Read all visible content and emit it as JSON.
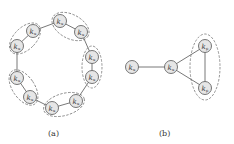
{
  "figure": {
    "panels": [
      {
        "id": "a",
        "caption": "(a)",
        "nodes": [
          {
            "label": "k",
            "sub": "u",
            "x": 60,
            "y": 21
          },
          {
            "label": "k",
            "sub": "u",
            "x": 81,
            "y": 32
          },
          {
            "label": "k",
            "sub": "u",
            "x": 92,
            "y": 57
          },
          {
            "label": "k",
            "sub": "u",
            "x": 92,
            "y": 77
          },
          {
            "label": "k",
            "sub": "u",
            "x": 76,
            "y": 101
          },
          {
            "label": "k",
            "sub": "u",
            "x": 52,
            "y": 108
          },
          {
            "label": "k",
            "sub": "u",
            "x": 30,
            "y": 97
          },
          {
            "label": "k",
            "sub": "u",
            "x": 17,
            "y": 78
          },
          {
            "label": "k",
            "sub": "u",
            "x": 17,
            "y": 46
          },
          {
            "label": "k",
            "sub": "u",
            "x": 33,
            "y": 31
          }
        ],
        "groups": 5
      },
      {
        "id": "b",
        "caption": "(b)",
        "nodes": [
          {
            "label": "k",
            "sub": "u",
            "x": 132,
            "y": 67
          },
          {
            "label": "k",
            "sub": "u",
            "x": 171,
            "y": 67
          },
          {
            "label": "k",
            "sub": "p",
            "x": 205,
            "y": 46
          },
          {
            "label": "k",
            "sub": "p",
            "x": 205,
            "y": 88
          }
        ],
        "groups": 1
      }
    ]
  }
}
